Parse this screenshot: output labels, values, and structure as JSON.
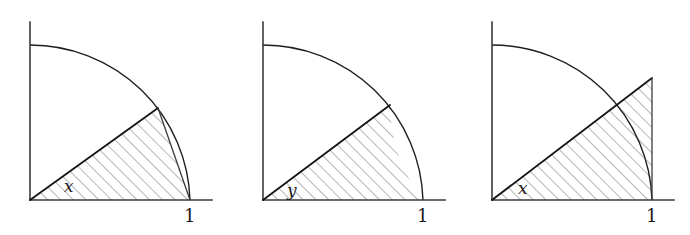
{
  "figure": {
    "title": "",
    "background_color": "#ffffff",
    "ink_color": "#1a1a1a",
    "hatch_color": "#6e6e6e",
    "panel_count": 3,
    "panels": [
      {
        "id": "panel-1",
        "name": "inscribed-triangle-panel",
        "angle_label": "x",
        "axis_label_x": "1",
        "region_description": "triangle-inscribed-in-quarter-circle",
        "shaded": true,
        "hatch_angle_deg": 45,
        "origin": [
          30,
          200
        ],
        "radius": 160,
        "x_axis_end": [
          212,
          200
        ],
        "y_axis_top": [
          30,
          22
        ],
        "arc_start": [
          190,
          200
        ],
        "arc_end": [
          30,
          45
        ],
        "chord_end": [
          158,
          108
        ],
        "vertical_drop_from": [
          158,
          108
        ],
        "vertical_drop_to": [
          190,
          200
        ]
      },
      {
        "id": "panel-2",
        "name": "circular-sector-panel",
        "angle_label": "y",
        "axis_label_x": "1",
        "region_description": "circular-sector-of-quarter-circle",
        "shaded": true,
        "hatch_angle_deg": 45,
        "origin": [
          263,
          200
        ],
        "radius": 160,
        "x_axis_end": [
          445,
          200
        ],
        "y_axis_top": [
          263,
          22
        ],
        "arc_start": [
          423,
          200
        ],
        "arc_end": [
          263,
          45
        ],
        "radius_end": [
          390,
          105
        ]
      },
      {
        "id": "panel-3",
        "name": "circumscribed-triangle-panel",
        "angle_label": "x",
        "axis_label_x": "1",
        "region_description": "triangle-circumscribing-sector-with-tangent-vertical-side",
        "shaded": true,
        "hatch_angle_deg": 45,
        "origin": [
          492,
          200
        ],
        "radius": 160,
        "x_axis_end": [
          674,
          200
        ],
        "y_axis_top": [
          492,
          22
        ],
        "arc_start": [
          652,
          200
        ],
        "arc_end": [
          492,
          45
        ],
        "apex": [
          652,
          78
        ],
        "vertical_side_from": [
          652,
          78
        ],
        "vertical_side_to": [
          652,
          200
        ]
      }
    ],
    "labels": {
      "angle_x": "x",
      "angle_y": "y",
      "unit_one": "1"
    }
  }
}
